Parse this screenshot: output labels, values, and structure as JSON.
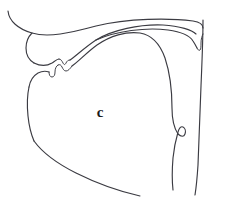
{
  "figure": {
    "kind": "midsagittal-vocal-tract-diagram",
    "label": "c",
    "background_color": "#ffffff",
    "line_color": "#3b3b42",
    "label_color": "#1a1a1a",
    "width": 227,
    "height": 210
  },
  "anatomy": {
    "parts": [
      {
        "name": "upper-lip",
        "label": "upper lip"
      },
      {
        "name": "upper-teeth",
        "label": "upper teeth"
      },
      {
        "name": "alveolar-ridge",
        "label": "alveolar ridge"
      },
      {
        "name": "hard-palate",
        "label": "hard palate"
      },
      {
        "name": "soft-palate-velum",
        "label": "soft palate (velum)"
      },
      {
        "name": "uvula",
        "label": "uvula"
      },
      {
        "name": "tongue-body",
        "label": "tongue"
      },
      {
        "name": "tongue-tip",
        "label": "tongue tip"
      },
      {
        "name": "lower-teeth",
        "label": "lower teeth"
      },
      {
        "name": "lower-lip",
        "label": "lower lip"
      },
      {
        "name": "jaw-chin",
        "label": "jaw / chin"
      },
      {
        "name": "epiglottis",
        "label": "epiglottis"
      },
      {
        "name": "pharyngeal-wall",
        "label": "pharyngeal wall"
      }
    ]
  },
  "paths": {
    "nasal_roof": "M 8 11 C 9 21, 18 29, 32 33 C 48 38, 70 33, 96 26 C 128 18, 170 18, 193 21 C 200 22, 203 25, 203 28",
    "upper_lip_front": "M 32 33 C 28 37, 26 42, 26 48 C 26 55, 29 60, 34 63",
    "upper_lip_inner": "M 34 63 C 40 66, 47 66, 52 63 C 55 61, 57 59, 59 59",
    "upper_teeth": "M 59 59 C 61 59, 62 61, 63 63 C 64 65, 65 65, 66 63 C 67 61, 68 60, 70 60",
    "hard_palate": "M 70 60 C 76 56, 84 48, 96 40 C 112 30, 140 24, 163 25 C 180 26, 192 30, 196 34",
    "velum": "M 96 40 C 116 31, 146 27, 168 30 C 182 32, 190 36, 193 41 C 195 44, 196 46, 197 48",
    "uvula": "M 197 48 C 198 50, 199 51, 200 50 C 201 49, 201 46, 201 43 C 201 39, 202 36, 203 34",
    "pharynx_wall": "M 203 20 C 203 40, 202 62, 201 86 C 200 112, 199 140, 198 165 C 197 180, 196 189, 195 195",
    "tongue_body": "M 72 66 C 78 62, 86 53, 97 45 C 110 36, 126 31, 140 33 C 152 35, 160 44, 165 58 C 170 73, 172 92, 172 108 C 172 120, 174 128, 178 134",
    "tongue_tip": "M 72 66 C 70 69, 68 71, 66 71 C 64 71, 63 69, 62 67 C 61 65, 60 64, 58 65",
    "lower_teeth": "M 58 65 C 56 66, 55 69, 55 72 C 55 75, 54 77, 52 77 C 50 77, 49 75, 49 72",
    "lower_lip": "M 49 72 C 46 71, 42 71, 38 73 C 33 76, 30 81, 29 87",
    "jaw_front": "M 29 87 C 27 96, 27 106, 28 116 C 29 126, 31 134, 34 141",
    "jaw_line": "M 34 141 C 42 152, 56 163, 76 173 C 98 184, 122 192, 140 196",
    "epiglottis": "M 178 134 C 181 137, 184 137, 185 134 C 186 131, 185 128, 183 127 C 181 126, 179 128, 178 132 C 176 139, 174 148, 173 158 C 172 170, 172 181, 173 190"
  }
}
